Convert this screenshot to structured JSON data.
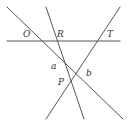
{
  "diagram": {
    "labels": {
      "O": "O",
      "R": "R",
      "T": "T",
      "a": "a",
      "b": "b",
      "P": "P"
    },
    "lines": [
      {
        "name": "horizontal-line",
        "x1": 7,
        "y1": 41,
        "x2": 120,
        "y2": 41
      },
      {
        "name": "line-through-O",
        "x1": 7,
        "y1": 7,
        "x2": 123,
        "y2": 119
      },
      {
        "name": "line-through-R",
        "x1": 46,
        "y1": 7,
        "x2": 84,
        "y2": 119
      },
      {
        "name": "line-through-T",
        "x1": 120,
        "y1": 7,
        "x2": 46,
        "y2": 119
      }
    ],
    "line_color": "#555555",
    "label_color": "#333333"
  }
}
